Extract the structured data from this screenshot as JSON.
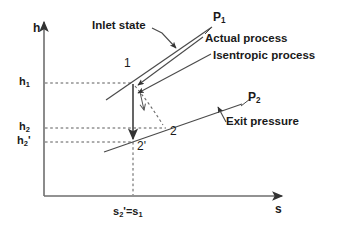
{
  "figure": {
    "type": "enthalpy-entropy-diagram",
    "background_color": "#ffffff",
    "line_color": "#404040",
    "text_color": "#1a1a1a"
  },
  "axes": {
    "y_label": "h",
    "x_label": "s",
    "y_axis_x": 44,
    "x_axis_y": 196,
    "y_arrow_tip_y": 18,
    "x_arrow_tip_x": 287
  },
  "y_ticks": [
    {
      "id": "h1",
      "html": "h<sub>1</sub>",
      "text": "h1",
      "y": 83
    },
    {
      "id": "h2",
      "html": "h<sub>2</sub>",
      "text": "h2",
      "y": 128
    },
    {
      "id": "h2p",
      "html": "h<sub>2</sub>'",
      "text": "h2'",
      "y": 142
    }
  ],
  "x_ticks": [
    {
      "id": "s2p_eq_s1",
      "html": "s<sub>2</sub>'=s<sub>1</sub>",
      "text": "s2'=s1",
      "x": 133
    }
  ],
  "points": [
    {
      "id": "1",
      "label": "1",
      "x": 133,
      "y": 83,
      "label_x": 124,
      "label_y": 63
    },
    {
      "id": "2",
      "label": "2",
      "x": 165,
      "y": 128,
      "label_x": 170,
      "label_y": 131
    },
    {
      "id": "2p",
      "label": "2'",
      "x": 133,
      "y": 142,
      "label_x": 137,
      "label_y": 146
    }
  ],
  "pressure_lines": [
    {
      "id": "P1",
      "html": "P<sub>1</sub>",
      "text": "P1",
      "label_x": 213,
      "label_y": 17
    },
    {
      "id": "P2",
      "html": "P<sub>2</sub>",
      "text": "P2",
      "label_x": 243,
      "label_y": 97
    }
  ],
  "annotations": [
    {
      "id": "inlet-state",
      "text": "Inlet state",
      "x": 92,
      "y": 25
    },
    {
      "id": "actual-process",
      "text": "Actual process",
      "x": 205,
      "y": 39
    },
    {
      "id": "isentropic-process",
      "text": "Isentropic process",
      "x": 213,
      "y": 55
    },
    {
      "id": "exit-pressure",
      "text": "Exit pressure",
      "x": 222,
      "y": 121
    }
  ],
  "processes": [
    {
      "id": "isentropic",
      "from": "1",
      "to": "2p",
      "style": "solid",
      "description": "vertical constant-entropy expansion"
    },
    {
      "id": "actual",
      "from": "1",
      "to": "2",
      "style": "dashed",
      "description": "irreversible expansion with entropy increase"
    }
  ]
}
